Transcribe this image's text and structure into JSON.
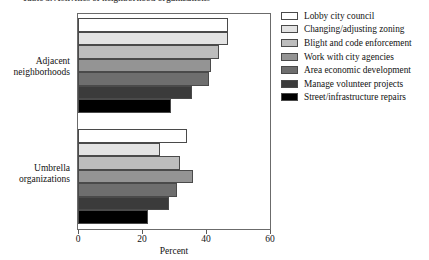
{
  "title": {
    "text": "Table 3. Activities of neighborhood organizations",
    "clipped": true
  },
  "axis": {
    "x_title": "Percent",
    "x_ticks": [
      "0",
      "20",
      "40",
      "60"
    ],
    "x_min": 0,
    "x_max": 60
  },
  "categories": [
    {
      "line1": "Adjacent",
      "line2": "neighborhoods"
    },
    {
      "line1": "Umbrella",
      "line2": "organizations"
    }
  ],
  "legend": {
    "items": [
      {
        "label": "Lobby city council",
        "color": "#ffffff"
      },
      {
        "label": "Changing/adjusting zoning",
        "color": "#e3e3e3"
      },
      {
        "label": "Blight and code enforcement",
        "color": "#bdbdbd"
      },
      {
        "label": "Work with city agencies",
        "color": "#949494"
      },
      {
        "label": "Area economic development",
        "color": "#6e6e6e"
      },
      {
        "label": "Manage volunteer projects",
        "color": "#3b3b3b"
      },
      {
        "label": "Street/infrastructure repairs",
        "color": "#000000"
      }
    ]
  },
  "chart_data": {
    "type": "bar",
    "orientation": "horizontal",
    "title": "Activities of neighborhood organizations",
    "xlabel": "Percent",
    "ylabel": "",
    "xlim": [
      0,
      60
    ],
    "xticks": [
      0,
      20,
      40,
      60
    ],
    "grid": false,
    "legend_position": "right",
    "categories": [
      "Adjacent neighborhoods",
      "Umbrella organizations"
    ],
    "series": [
      {
        "name": "Lobby city council",
        "color": "#ffffff",
        "values": [
          47,
          34
        ]
      },
      {
        "name": "Changing/adjusting zoning",
        "color": "#e3e3e3",
        "values": [
          47,
          25.5
        ]
      },
      {
        "name": "Blight and code enforcement",
        "color": "#bdbdbd",
        "values": [
          44,
          32
        ]
      },
      {
        "name": "Work with city agencies",
        "color": "#949494",
        "values": [
          41.5,
          36
        ]
      },
      {
        "name": "Area economic development",
        "color": "#6e6e6e",
        "values": [
          41,
          31
        ]
      },
      {
        "name": "Manage volunteer projects",
        "color": "#3b3b3b",
        "values": [
          35.5,
          28.5
        ]
      },
      {
        "name": "Street/infrastructure repairs",
        "color": "#000000",
        "values": [
          29,
          22
        ]
      }
    ]
  }
}
